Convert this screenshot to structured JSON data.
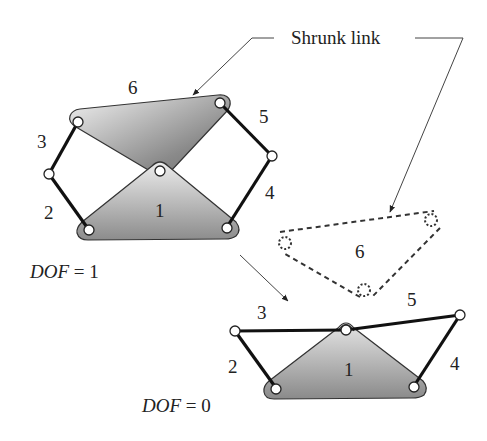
{
  "callout": {
    "text": "Shrunk link"
  },
  "top_mechanism": {
    "dof_label": "DOF",
    "dof_rest": " = 1",
    "labels": {
      "link1": "1",
      "link2": "2",
      "link3": "3",
      "link4": "4",
      "link5": "5",
      "link6": "6"
    }
  },
  "shrunk_link": {
    "label": "6"
  },
  "bottom_mechanism": {
    "dof_label": "DOF",
    "dof_rest": " = 0",
    "labels": {
      "link1": "1",
      "link2": "2",
      "link3": "3",
      "link4": "4",
      "link5": "5"
    }
  },
  "colors": {
    "link_fill_dark": "#7d7d7d",
    "link_fill_light": "#e8e8e8",
    "bar": "#111111",
    "outline": "#333333"
  }
}
